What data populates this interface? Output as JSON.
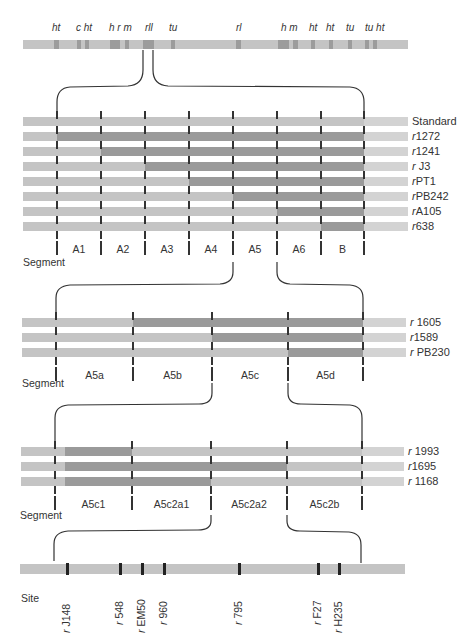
{
  "title_fragment": "",
  "chromosome": {
    "gene_labels": [
      {
        "text": "ht",
        "x": 52
      },
      {
        "text": "c ht",
        "x": 76
      },
      {
        "text": "h r m",
        "x": 109
      },
      {
        "text": "rll",
        "x": 145
      },
      {
        "text": "tu",
        "x": 169
      },
      {
        "text": "rl",
        "x": 236
      },
      {
        "text": "h  m",
        "x": 281
      },
      {
        "text": "ht",
        "x": 309
      },
      {
        "text": "ht",
        "x": 326
      },
      {
        "text": "tu",
        "x": 346
      },
      {
        "text": "tu ht",
        "x": 365
      }
    ]
  },
  "section1": {
    "rows": [
      {
        "label": "Standard",
        "prefix": "",
        "name": "Standard"
      },
      {
        "label": "r1272",
        "prefix": "r",
        "name": "1272"
      },
      {
        "label": "r1241",
        "prefix": "r",
        "name": "1241"
      },
      {
        "label": "rJ3",
        "prefix": "r",
        "name": " J3"
      },
      {
        "label": "rPT1",
        "prefix": "r",
        "name": "PT1"
      },
      {
        "label": "rPB242",
        "prefix": "r",
        "name": "PB242"
      },
      {
        "label": "rA105",
        "prefix": "r",
        "name": "A105"
      },
      {
        "label": "r638",
        "prefix": "r",
        "name": "638"
      }
    ],
    "segments": [
      "A1",
      "A2",
      "A3",
      "A4",
      "A5",
      "A6",
      "B"
    ],
    "axis_label": "Segment"
  },
  "section2": {
    "rows": [
      {
        "label": "r1605",
        "prefix": "r",
        "name": " 1605"
      },
      {
        "label": "r1589",
        "prefix": "r",
        "name": "1589"
      },
      {
        "label": "rPB230",
        "prefix": "r",
        "name": " PB230"
      }
    ],
    "segments": [
      "A5a",
      "A5b",
      "A5c",
      "A5d"
    ],
    "axis_label": "Segment"
  },
  "section3": {
    "rows": [
      {
        "label": "r1993",
        "prefix": "r",
        "name": " 1993"
      },
      {
        "label": "r1695",
        "prefix": "r",
        "name": "1695"
      },
      {
        "label": "r1168",
        "prefix": "r",
        "name": " 1168"
      }
    ],
    "segments": [
      "A5c1",
      "A5c2a1",
      "A5c2a2",
      "A5c2b"
    ],
    "axis_label": "Segment"
  },
  "sites": {
    "axis_label": "Site",
    "items": [
      {
        "prefix": "r",
        "name": " J148",
        "x": 67
      },
      {
        "prefix": "r",
        "name": " 548",
        "x": 120
      },
      {
        "prefix": "r",
        "name": " EM50",
        "x": 142
      },
      {
        "prefix": "r",
        "name": " 960",
        "x": 164
      },
      {
        "prefix": "r",
        "name": " 795",
        "x": 239
      },
      {
        "prefix": "r",
        "name": " F27",
        "x": 318
      },
      {
        "prefix": "r",
        "name": " H235",
        "x": 339
      }
    ]
  },
  "colors": {
    "bar_light": "#c4c4c4",
    "bar_dark": "#9a9a9a",
    "tick": "#333333",
    "text": "#333333"
  }
}
